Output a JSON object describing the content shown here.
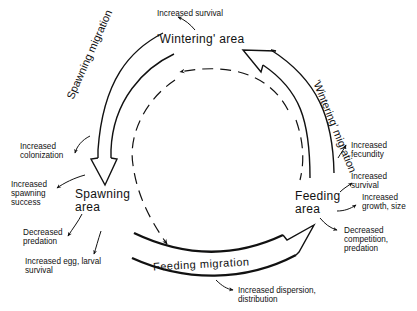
{
  "diagram": {
    "type": "migration cycle",
    "nodes": [
      {
        "id": "wintering",
        "label": "'Wintering' area"
      },
      {
        "id": "spawning",
        "label": "Spawning\narea"
      },
      {
        "id": "feeding",
        "label": "Feeding\narea"
      }
    ],
    "edges": [
      {
        "from": "wintering",
        "to": "spawning",
        "label": "Spawning migration"
      },
      {
        "from": "spawning",
        "to": "feeding",
        "label": "Feeding migration"
      },
      {
        "from": "feeding",
        "to": "wintering",
        "label": "'Wintering' migration"
      },
      {
        "from": "wintering",
        "to": "feeding",
        "style": "dashed",
        "label": ""
      }
    ],
    "annotations": {
      "wintering": [
        "Increased survival"
      ],
      "spawning_migration": [
        "Increased colonization"
      ],
      "spawning": [
        "Increased spawning success",
        "Decreased predation",
        "Increased egg, larval survival"
      ],
      "feeding_migration": [
        "Increased dispersion, distribution"
      ],
      "wintering_migration": [
        "Increased fecundity"
      ],
      "feeding": [
        "Increased survival",
        "Increased growth, size",
        "Decreased competition, predation"
      ]
    }
  },
  "labels": {
    "wintering_area": "'Wintering' area",
    "spawning_area": "Spawning\narea",
    "feeding_area": "Feeding\narea",
    "spawning_migration": "Spawning migration",
    "feeding_migration": "Feeding migration",
    "wintering_migration": "'Wintering' migration",
    "increased_survival_top": "Increased survival",
    "increased_colonization": "Increased\ncolonization",
    "increased_spawning_success": "Increased\nspawning\nsuccess",
    "decreased_predation": "Decreased\npredation",
    "increased_egg_larval": "Increased egg, larval\nsurvival",
    "increased_dispersion": "Increased dispersion,\ndistribution",
    "increased_fecundity": "Increased\nfecundity",
    "increased_survival_feeding": "Increased\nsurvival",
    "increased_growth": "Increased\ngrowth, size",
    "decreased_competition": "Decreased\ncompetition,\npredation"
  }
}
